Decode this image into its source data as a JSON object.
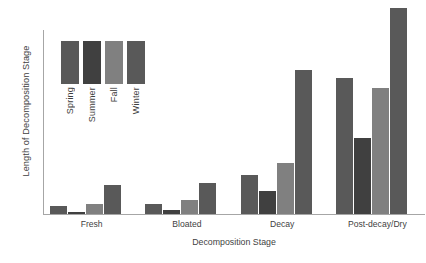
{
  "chart_data": {
    "type": "bar",
    "title": "",
    "xlabel": "Decomposition Stage",
    "ylabel": "Length of Decomposition Stage",
    "categories": [
      "Fresh",
      "Bloated",
      "Decay",
      "Post-decay/Dry"
    ],
    "series": [
      {
        "name": "Spring",
        "color": "#595959",
        "values": [
          4,
          5,
          19,
          66
        ]
      },
      {
        "name": "Summer",
        "color": "#404040",
        "values": [
          1,
          2,
          11,
          37
        ]
      },
      {
        "name": "Fall",
        "color": "#808080",
        "values": [
          5,
          7,
          25,
          61
        ]
      },
      {
        "name": "Winter",
        "color": "#595959",
        "values": [
          14,
          15,
          70,
          100
        ]
      }
    ],
    "ylim": [
      0,
      100
    ],
    "y_ticks_shown": false,
    "grid": false,
    "legend_position": "inside-upper-left",
    "axis_color": "#a6a6a6"
  },
  "axes": {
    "y_title": "Length of Decomposition Stage",
    "x_title": "Decomposition Stage"
  },
  "legend": {
    "entries": [
      {
        "label": "Spring"
      },
      {
        "label": "Summer"
      },
      {
        "label": "Fall"
      },
      {
        "label": "Winter"
      }
    ]
  }
}
